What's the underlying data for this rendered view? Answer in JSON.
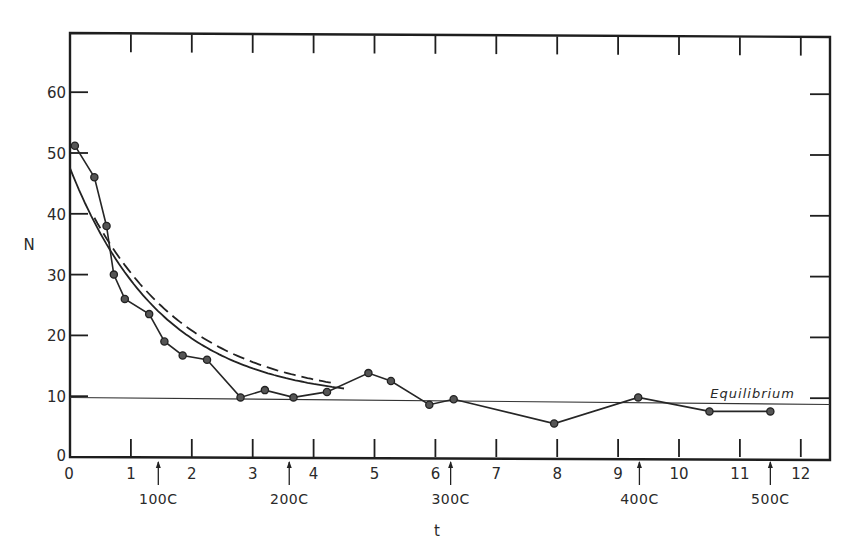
{
  "chart_data": {
    "type": "line",
    "title": "",
    "xlabel": "t",
    "ylabel": "N",
    "xlim": [
      0,
      12.5
    ],
    "ylim": [
      0,
      70
    ],
    "x_ticks": [
      0,
      1,
      2,
      3,
      4,
      5,
      6,
      7,
      8,
      9,
      10,
      11,
      12
    ],
    "x_tick_labels": [
      "0",
      "1",
      "2",
      "3",
      "4",
      "5",
      "6",
      "7",
      "8",
      "9",
      "10",
      "11",
      "12"
    ],
    "y_ticks": [
      0,
      10,
      20,
      30,
      40,
      50,
      60
    ],
    "y_tick_labels": [
      "0",
      "10",
      "20",
      "30",
      "40",
      "50",
      "60"
    ],
    "grid": false,
    "series": [
      {
        "name": "observed",
        "style": "line-with-markers",
        "x": [
          0.08,
          0.4,
          0.6,
          0.72,
          0.9,
          1.3,
          1.55,
          1.85,
          2.25,
          2.8,
          3.2,
          3.67,
          4.22,
          4.9,
          5.27,
          5.9,
          6.3,
          7.95,
          9.33,
          10.5,
          11.5
        ],
        "y": [
          51.2,
          46,
          38,
          30,
          26,
          23.5,
          19,
          16.7,
          16,
          9.8,
          11,
          9.8,
          10.7,
          13.8,
          12.5,
          8.6,
          9.5,
          5.5,
          9.8,
          7.5,
          7.5
        ]
      },
      {
        "name": "theoretical-solid",
        "style": "solid",
        "model": "N = 9.3 + 38.2*exp(-0.66 t)",
        "x_range": [
          0,
          4.5
        ]
      },
      {
        "name": "theoretical-dashed",
        "style": "dashed",
        "model": "N = 9.3 + 38.2*exp(-0.6 t)",
        "x_range": [
          0.4,
          4.3
        ]
      }
    ],
    "reference_lines": [
      {
        "name": "equilibrium",
        "label": "Equilibrium",
        "y": 9.3
      }
    ],
    "annotations": [
      {
        "label": "100C",
        "x": 1.45
      },
      {
        "label": "200C",
        "x": 3.6
      },
      {
        "label": "300C",
        "x": 6.25
      },
      {
        "label": "400C",
        "x": 9.35
      },
      {
        "label": "500C",
        "x": 11.5
      }
    ]
  }
}
